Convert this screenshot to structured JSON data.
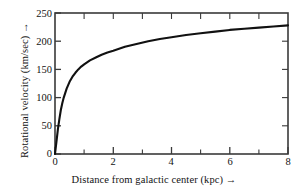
{
  "chart_data": {
    "type": "line",
    "title": "",
    "xlabel": "Distance from galactic center (kpc) →",
    "ylabel": "Rotational velocity (km/sec) →",
    "xlim": [
      0,
      8
    ],
    "ylim": [
      0,
      250
    ],
    "grid": false,
    "legend": null,
    "x_ticks": [
      0,
      2,
      4,
      6,
      8
    ],
    "x_tick_labels": [
      "0",
      "2",
      "4",
      "6",
      "8"
    ],
    "x_minor_ticks": [
      1,
      2,
      3,
      4,
      5,
      6,
      7
    ],
    "y_ticks": [
      0,
      50,
      100,
      150,
      200,
      250
    ],
    "y_tick_labels": [
      "0",
      "50",
      "100",
      "150",
      "200",
      "250"
    ],
    "line_color": "#111111",
    "line_width": 2.1,
    "series": [
      {
        "name": "Galactic rotation curve",
        "x": [
          0.0,
          0.05,
          0.1,
          0.15,
          0.2,
          0.25,
          0.3,
          0.4,
          0.5,
          0.6,
          0.7,
          0.8,
          0.9,
          1.0,
          1.2,
          1.4,
          1.6,
          1.8,
          2.0,
          2.4,
          2.8,
          3.2,
          3.6,
          4.0,
          4.5,
          5.0,
          5.5,
          6.0,
          6.5,
          7.0,
          7.5,
          8.0
        ],
        "y": [
          0,
          22,
          44,
          62,
          78,
          90,
          100,
          116,
          128,
          137,
          144,
          150,
          155,
          159,
          166,
          171,
          176,
          180,
          183,
          190,
          195,
          200,
          204,
          207,
          211,
          214,
          217,
          220,
          222,
          224,
          226,
          228
        ]
      }
    ]
  },
  "axis_labels": {
    "y_title": "Rotational velocity (km/sec) →",
    "x_title": "Distance from galactic center (kpc) →"
  }
}
